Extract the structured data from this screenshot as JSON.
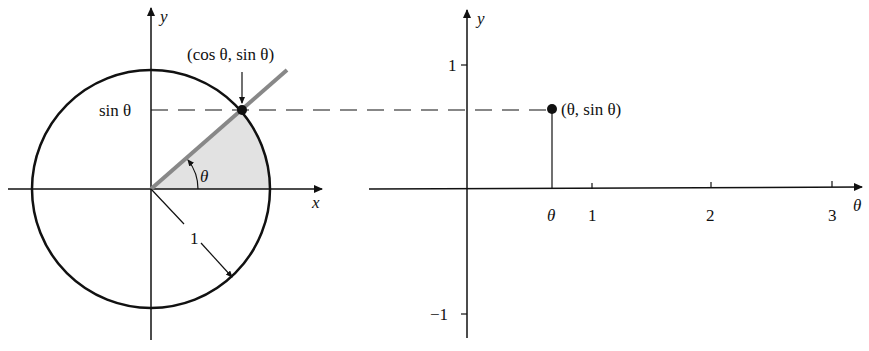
{
  "left_figure": {
    "title": "unit circle",
    "axis_x_label": "x",
    "axis_y_label": "y",
    "point_label": "(cos θ, sin θ)",
    "sin_label": "sin θ",
    "angle_label": "θ",
    "radius_label": "1"
  },
  "right_figure": {
    "axis_x_label": "θ",
    "axis_y_label": "y",
    "point_label": "(θ, sin θ)",
    "x_ticks": [
      "θ",
      "1",
      "2",
      "3"
    ],
    "y_ticks": [
      "1",
      "−1"
    ]
  },
  "colors": {
    "ink": "#111111",
    "ray": "#888888",
    "shade": "#e2e2e2"
  }
}
